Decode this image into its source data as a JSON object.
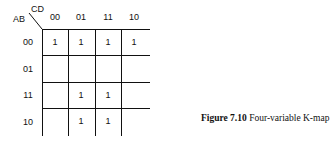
{
  "kmap": {
    "row_var": "AB",
    "col_var": "CD",
    "columns": [
      "00",
      "01",
      "11",
      "10"
    ],
    "rows": [
      {
        "label": "00",
        "cells": [
          "1",
          "1",
          "1",
          "1"
        ]
      },
      {
        "label": "01",
        "cells": [
          "",
          "",
          "",
          ""
        ]
      },
      {
        "label": "11",
        "cells": [
          "",
          "1",
          "1",
          ""
        ]
      },
      {
        "label": "10",
        "cells": [
          "",
          "1",
          "1",
          ""
        ]
      }
    ]
  },
  "caption": {
    "number": "Figure 7.10",
    "text": "Four-variable K-map"
  }
}
